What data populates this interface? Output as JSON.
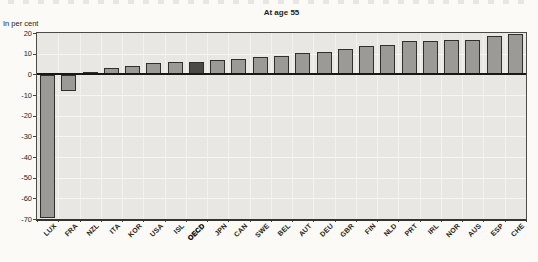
{
  "chart_data": {
    "type": "bar",
    "title": "At age 55",
    "unit_label": "In per cent",
    "categories": [
      "LUX",
      "FRA",
      "NZL",
      "ITA",
      "KOR",
      "USA",
      "ISL",
      "OECD",
      "JPN",
      "CAN",
      "SWE",
      "BEL",
      "AUT",
      "DEU",
      "GBR",
      "FIN",
      "NLD",
      "PRT",
      "IRL",
      "NOR",
      "AUS",
      "ESP",
      "CHE"
    ],
    "values": [
      -69,
      -7.5,
      1,
      3,
      4,
      5.5,
      6,
      6,
      7,
      7.5,
      8.5,
      9,
      10.5,
      11,
      12.5,
      13.5,
      14,
      16,
      16,
      16.5,
      16.5,
      18.5,
      19.5
    ],
    "highlight_category": "OECD",
    "ylim": [
      -70,
      20
    ],
    "yticks": [
      20,
      10,
      0,
      -10,
      -20,
      -30,
      -40,
      -50,
      -60,
      -70
    ],
    "grid": "on",
    "legend": "none",
    "colors": {
      "bar": "#9b9a96",
      "bar_border": "#302f2b",
      "highlight_bar": "#4b4a46",
      "plot_background": "#e8e7e3",
      "gridline": "#f5f5f2",
      "frame": "#4d4b46",
      "zero_line": "#191816",
      "text": "#1e1d1a",
      "page_background": "#fbfaf7"
    }
  }
}
